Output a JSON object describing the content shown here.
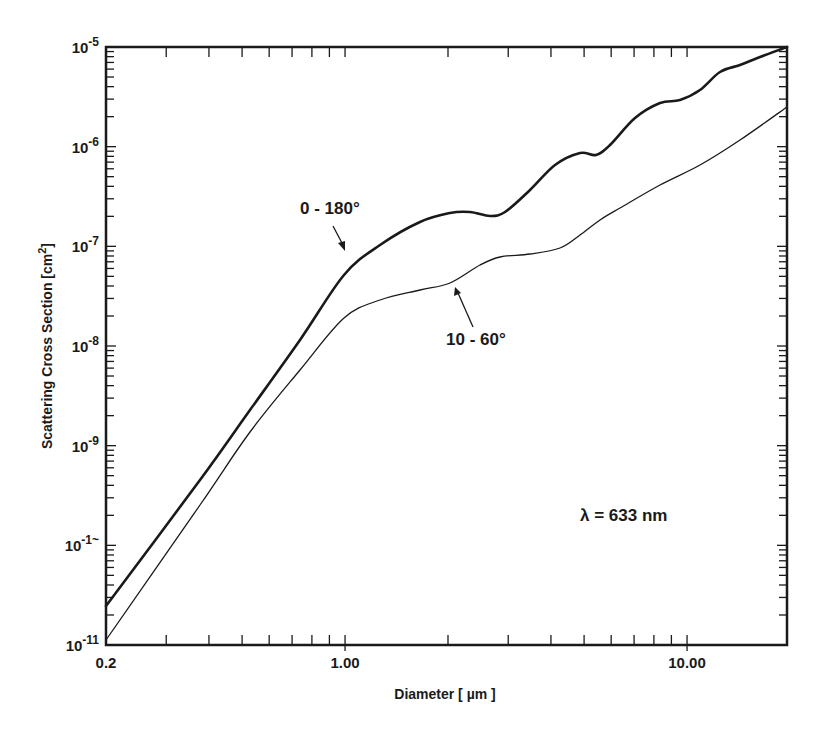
{
  "chart_data": {
    "type": "line",
    "title": "",
    "xlabel": "Diameter [µm]",
    "ylabel": "Scattering Cross Section [cm²]",
    "xscale": "log",
    "yscale": "log",
    "xlim": [
      0.2,
      20
    ],
    "ylim": [
      1e-11,
      1e-05
    ],
    "grid": false,
    "x_tick_labels": [
      {
        "value": 0.2,
        "label": "0.2"
      },
      {
        "value": 1.0,
        "label": "1.00"
      },
      {
        "value": 10.0,
        "label": "10.00"
      }
    ],
    "y_tick_labels": [
      {
        "value": 1e-05,
        "base": "10",
        "exp": "-5"
      },
      {
        "value": 1e-06,
        "base": "10",
        "exp": "-6"
      },
      {
        "value": 1e-07,
        "base": "10",
        "exp": "-7"
      },
      {
        "value": 1e-08,
        "base": "10",
        "exp": "-8"
      },
      {
        "value": 1e-09,
        "base": "10",
        "exp": "-9"
      },
      {
        "value": 1e-10,
        "base": "10",
        "exp": "-1~"
      },
      {
        "value": 1e-11,
        "base": "10",
        "exp": "-11"
      }
    ],
    "series": [
      {
        "name": "0 - 180°",
        "stroke_width": 2.6,
        "color": "#1a1a1a",
        "points": [
          [
            0.2,
            2.5e-11
          ],
          [
            0.3,
            4.5e-10
          ],
          [
            0.35,
            2.2e-09
          ],
          [
            0.49,
            1.1e-08
          ],
          [
            0.7,
            5.8e-08
          ],
          [
            1.0,
            2.6e-07
          ],
          [
            1.27,
            5.1e-07
          ],
          [
            1.66,
            8.6e-07
          ],
          [
            2.04,
            1.06e-06
          ],
          [
            2.33,
            1.08e-06
          ],
          [
            2.67,
            9.9e-07
          ],
          [
            2.95,
            1.06e-06
          ],
          [
            3.52,
            1.8e-06
          ],
          [
            4.2,
            3.1e-06
          ],
          [
            5.0,
            4e-06
          ],
          [
            5.5,
            3.9e-06
          ],
          [
            6.1,
            4.8e-06
          ],
          [
            7.2,
            9e-06
          ],
          [
            8.5,
            1.25e-05
          ],
          [
            9.7,
            1.3e-05
          ],
          [
            11.2,
            1.65e-05
          ],
          [
            12.9,
            2.5e-05
          ],
          [
            14.8,
            2.9e-05
          ],
          [
            17.0,
            3.5e-05
          ],
          [
            19.7,
            4.4e-05
          ]
        ]
      },
      {
        "name": "10 - 60°",
        "stroke_width": 1.3,
        "color": "#1a1a1a",
        "points": [
          [
            0.2,
            1.1e-11
          ],
          [
            0.3,
            2e-10
          ],
          [
            0.35,
            1.2e-09
          ],
          [
            0.49,
            5.5e-09
          ],
          [
            0.7,
            2.3e-08
          ],
          [
            1.0,
            7.6e-08
          ],
          [
            1.27,
            1.15e-07
          ],
          [
            1.66,
            1.45e-07
          ],
          [
            2.04,
            1.7e-07
          ],
          [
            2.51,
            2.6e-07
          ],
          [
            2.87,
            3.1e-07
          ],
          [
            3.52,
            3.3e-07
          ],
          [
            4.3,
            3.8e-07
          ],
          [
            4.92,
            5.2e-07
          ],
          [
            5.6,
            7.2e-07
          ],
          [
            6.4,
            9.5e-07
          ],
          [
            8.5,
            1.6e-06
          ],
          [
            11.2,
            2.6e-06
          ],
          [
            14.8,
            4.4e-06
          ],
          [
            19.7,
            9e-06
          ]
        ]
      }
    ],
    "annotations": [
      {
        "text": "0 - 180°",
        "points_to_series": "0 - 180°"
      },
      {
        "text": "10 - 60°",
        "points_to_series": "10 - 60°"
      },
      {
        "text": "λ = 633 nm"
      }
    ]
  },
  "labels": {
    "xlabel_text": "Diameter",
    "xlabel_unit": "µm",
    "ylabel_text": "Scattering Cross Section",
    "ylabel_unit": "cm",
    "ylabel_unit_exp": "2",
    "annot_0_180": "0 - 180°",
    "annot_10_60": "10 - 60°",
    "annot_lambda": "λ = 633 nm"
  }
}
